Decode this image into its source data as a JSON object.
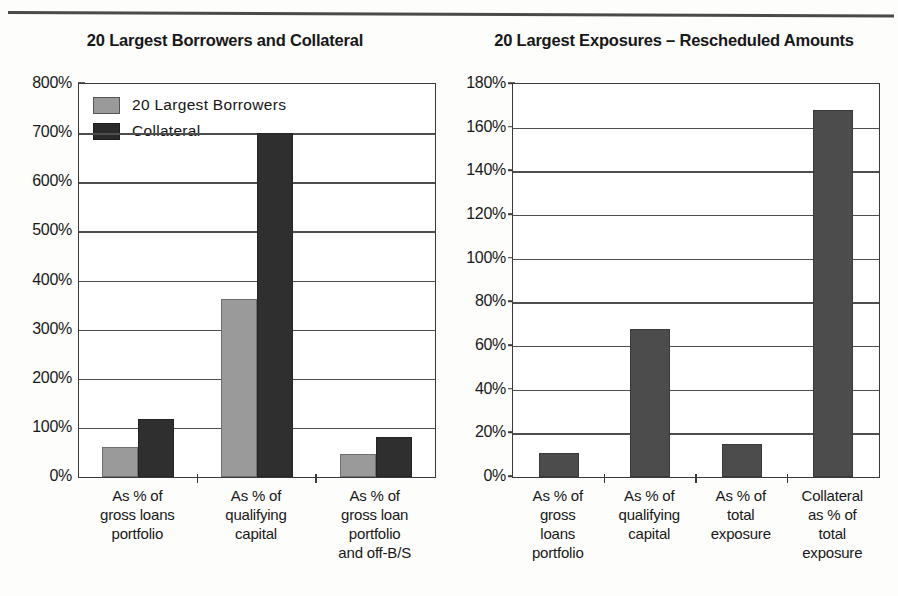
{
  "page": {
    "divider": "horizontal-rule"
  },
  "charts": [
    {
      "id": "left",
      "title": "20 Largest Borrowers and Collateral",
      "legend": [
        {
          "label": "20 Largest Borrowers",
          "color": "#9a9a9a"
        },
        {
          "label": "Collateral",
          "color": "#2a2a2a"
        }
      ],
      "chart_data": {
        "type": "bar",
        "title": "20 Largest Borrowers and Collateral",
        "xlabel": "",
        "ylabel": "",
        "ylim": [
          0,
          800
        ],
        "yticks": [
          0,
          100,
          200,
          300,
          400,
          500,
          600,
          700,
          800
        ],
        "ytick_labels": [
          "0%",
          "100%",
          "200%",
          "300%",
          "400%",
          "500%",
          "600%",
          "700%",
          "800%"
        ],
        "grid": true,
        "legend_position": "upper-left-inside",
        "categories": [
          "As % of\ngross loans\nportfolio",
          "As % of\nqualifying\ncapital",
          "As % of\ngross loan\nportfolio\nand off-B/S"
        ],
        "series": [
          {
            "name": "20 Largest Borrowers",
            "values": [
              62,
              363,
              47
            ]
          },
          {
            "name": "Collateral",
            "values": [
              119,
              700,
              81
            ]
          }
        ]
      }
    },
    {
      "id": "right",
      "title": "20 Largest Exposures – Rescheduled Amounts",
      "legend": [],
      "chart_data": {
        "type": "bar",
        "title": "20 Largest Exposures – Rescheduled Amounts",
        "xlabel": "",
        "ylabel": "",
        "ylim": [
          0,
          180
        ],
        "yticks": [
          0,
          20,
          40,
          60,
          80,
          100,
          120,
          140,
          160,
          180
        ],
        "ytick_labels": [
          "0%",
          "20%",
          "40%",
          "60%",
          "80%",
          "100%",
          "120%",
          "140%",
          "160%",
          "180%"
        ],
        "grid": true,
        "legend_position": "none",
        "categories": [
          "As % of\ngross\nloans\nportfolio",
          "As % of\nqualifying\ncapital",
          "As % of\ntotal\nexposure",
          "Collateral\nas % of\ntotal\nexposure"
        ],
        "series": [
          {
            "name": "Rescheduled Amounts",
            "values": [
              11,
              68,
              15,
              168
            ]
          }
        ]
      }
    }
  ]
}
